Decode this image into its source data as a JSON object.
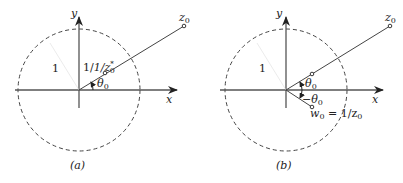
{
  "colors": {
    "background": "#ffffff",
    "ink": "#222222",
    "axis": "#555555",
    "circle": "#444444"
  },
  "panels": [
    {
      "id": "a",
      "caption": "(a)",
      "axes": {
        "x_label": "x",
        "y_label": "y"
      },
      "unit_circle_radius_label": "1",
      "points": {
        "outer": {
          "label": "z",
          "sub": "0"
        },
        "inner": {
          "label": "1/z",
          "sup": "*",
          "sub": "0"
        }
      },
      "angle": {
        "label": "θ",
        "sub": "0"
      }
    },
    {
      "id": "b",
      "caption": "(b)",
      "axes": {
        "x_label": "x",
        "y_label": "y"
      },
      "unit_circle_radius_label": "1",
      "points": {
        "outer": {
          "label": "z",
          "sub": "0"
        },
        "reflected": {
          "label": "w",
          "sub": "0",
          "eq": " = 1/z",
          "eq_sub": "0"
        }
      },
      "angle_upper": {
        "label": "θ",
        "sub": "0"
      },
      "angle_lower": {
        "prefix": "−θ",
        "sub": "0"
      }
    }
  ]
}
